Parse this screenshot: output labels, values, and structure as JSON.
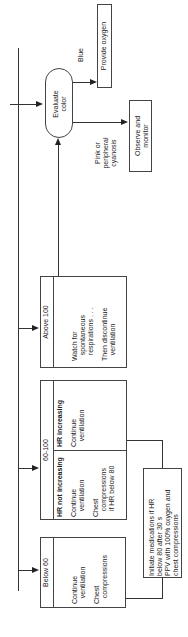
{
  "diagram": {
    "orientation": "rotated-90-ccw",
    "decision": {
      "line1": "Evaluate",
      "line2": "color"
    },
    "branches": {
      "blue": {
        "label": "Blue",
        "action": "Provide oxygen"
      },
      "pink": {
        "label_lines": [
          "Pink or",
          "peripheral",
          "cyanosis"
        ],
        "action_lines": [
          "Observe and",
          "monitor"
        ]
      }
    },
    "hr_boxes": {
      "above100": {
        "header": "Above 100",
        "lines": [
          "Watch for",
          "   spontaneous",
          "   respirations . . .",
          "",
          "Then discontinue",
          "   ventilation"
        ]
      },
      "range60_100": {
        "header": "60-100",
        "increasing": {
          "title": "HR increasing",
          "lines": [
            "Continue",
            "   ventilation"
          ]
        },
        "not_increasing": {
          "title": "HR not increasing",
          "lines": [
            "Continue",
            "   ventilation",
            "",
            "Chest",
            "   compressions",
            "   if HR below 80"
          ]
        }
      },
      "below60": {
        "header": "Below 60",
        "lines": [
          "Continue",
          "   ventilation",
          "",
          "Chest",
          "   compressions"
        ]
      }
    },
    "medications": {
      "lines": [
        "Initiate medications if HR",
        "below 80 after 30 s",
        "PPV with 100% oxygen and",
        "chest compressions"
      ]
    }
  }
}
